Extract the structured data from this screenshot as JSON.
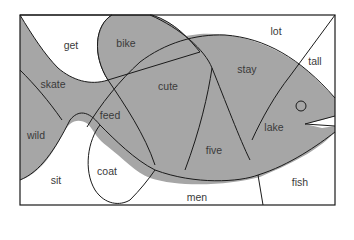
{
  "colors": {
    "background": "#ffffff",
    "shaded": "#a6a6a6",
    "line": "#1a1a1a",
    "text": "#3a3a3a"
  },
  "diagram": {
    "regions": [
      {
        "id": "get",
        "label": "get",
        "shaded": false,
        "x": 71,
        "y": 45
      },
      {
        "id": "bike",
        "label": "bike",
        "shaded": true,
        "x": 126,
        "y": 43
      },
      {
        "id": "lot",
        "label": "lot",
        "shaded": false,
        "x": 276,
        "y": 31
      },
      {
        "id": "tall",
        "label": "tall",
        "shaded": false,
        "x": 315,
        "y": 61
      },
      {
        "id": "skate",
        "label": "skate",
        "shaded": true,
        "x": 53,
        "y": 84
      },
      {
        "id": "cute",
        "label": "cute",
        "shaded": true,
        "x": 168,
        "y": 86
      },
      {
        "id": "stay",
        "label": "stay",
        "shaded": true,
        "x": 247,
        "y": 69
      },
      {
        "id": "feed",
        "label": "feed",
        "shaded": true,
        "x": 110,
        "y": 115
      },
      {
        "id": "wild",
        "label": "wild",
        "shaded": true,
        "x": 36,
        "y": 135
      },
      {
        "id": "lake",
        "label": "lake",
        "shaded": true,
        "x": 274,
        "y": 127
      },
      {
        "id": "five",
        "label": "five",
        "shaded": true,
        "x": 214,
        "y": 150
      },
      {
        "id": "coat",
        "label": "coat",
        "shaded": false,
        "x": 107,
        "y": 171
      },
      {
        "id": "sit",
        "label": "sit",
        "shaded": false,
        "x": 56,
        "y": 180
      },
      {
        "id": "men",
        "label": "men",
        "shaded": false,
        "x": 197,
        "y": 197
      },
      {
        "id": "fish",
        "label": "fish",
        "shaded": false,
        "x": 300,
        "y": 182
      }
    ]
  }
}
